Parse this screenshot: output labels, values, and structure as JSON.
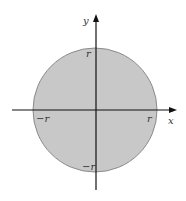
{
  "diagram": {
    "title": "",
    "axes": {
      "x_label": "x",
      "y_label": "y"
    },
    "labels": {
      "top": "r",
      "right": "r",
      "left": "−r",
      "bottom": "−r"
    },
    "colors": {
      "disk_fill": "#c8c8c8",
      "disk_stroke": "#8a8a8a",
      "axis": "#111111",
      "background": "#ffffff"
    }
  }
}
